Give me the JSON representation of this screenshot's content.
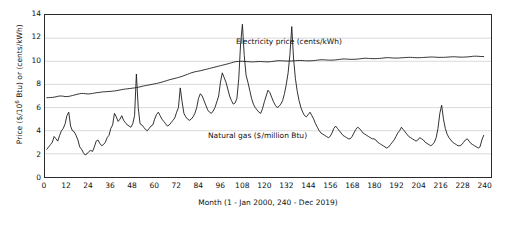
{
  "chart_data": {
    "type": "line",
    "title": "",
    "xlabel": "Month (1 - Jan 2000, 240 - Dec 2019)",
    "ylabel_html": "Price ($/10<sup>6</sup> Btu) or (cents/kWh)",
    "ylabel": "Price ($/10^6 Btu) or (cents/kWh)",
    "xlim": [
      0,
      244
    ],
    "ylim": [
      0,
      14
    ],
    "xticks": [
      0,
      12,
      24,
      36,
      48,
      60,
      72,
      84,
      96,
      108,
      120,
      132,
      144,
      156,
      168,
      180,
      192,
      204,
      216,
      228,
      240
    ],
    "yticks": [
      0,
      2,
      4,
      6,
      8,
      10,
      12,
      14
    ],
    "grid": "horizontal",
    "legend_position": "inline-annotations",
    "annotations": [
      {
        "name": "electricity-price",
        "text": "Electricity price (cents/kWh)"
      },
      {
        "name": "natural-gas",
        "text": "Natural gas ($/million Btu)"
      }
    ],
    "series": [
      {
        "name": "Electricity price (cents/kWh)",
        "color": "#1a1a1a",
        "values": [
          6.85,
          6.86,
          6.87,
          6.88,
          6.9,
          6.93,
          6.97,
          7.0,
          7.0,
          6.98,
          6.95,
          6.95,
          6.97,
          7.0,
          7.04,
          7.08,
          7.12,
          7.16,
          7.2,
          7.22,
          7.22,
          7.2,
          7.18,
          7.18,
          7.2,
          7.22,
          7.25,
          7.28,
          7.3,
          7.32,
          7.34,
          7.36,
          7.37,
          7.38,
          7.39,
          7.4,
          7.42,
          7.44,
          7.46,
          7.49,
          7.52,
          7.55,
          7.58,
          7.6,
          7.62,
          7.64,
          7.66,
          7.68,
          7.7,
          7.73,
          7.76,
          7.79,
          7.83,
          7.87,
          7.9,
          7.93,
          7.96,
          7.99,
          8.02,
          8.05,
          8.08,
          8.12,
          8.16,
          8.2,
          8.25,
          8.3,
          8.35,
          8.4,
          8.44,
          8.48,
          8.52,
          8.56,
          8.6,
          8.65,
          8.7,
          8.76,
          8.82,
          8.88,
          8.94,
          9.0,
          9.05,
          9.09,
          9.12,
          9.15,
          9.18,
          9.22,
          9.26,
          9.3,
          9.34,
          9.38,
          9.42,
          9.46,
          9.5,
          9.54,
          9.58,
          9.62,
          9.66,
          9.7,
          9.74,
          9.78,
          9.82,
          9.87,
          9.92,
          9.96,
          9.98,
          9.99,
          10.0,
          10.0,
          9.99,
          9.98,
          9.97,
          9.96,
          9.95,
          9.95,
          9.96,
          9.97,
          9.98,
          9.98,
          9.97,
          9.96,
          9.95,
          9.95,
          9.96,
          9.98,
          10.0,
          10.02,
          10.04,
          10.05,
          10.05,
          10.04,
          10.03,
          10.02,
          10.02,
          10.02,
          10.03,
          10.04,
          10.05,
          10.06,
          10.07,
          10.07,
          10.06,
          10.05,
          10.04,
          10.04,
          10.04,
          10.05,
          10.06,
          10.08,
          10.1,
          10.12,
          10.13,
          10.13,
          10.12,
          10.11,
          10.1,
          10.1,
          10.1,
          10.11,
          10.12,
          10.14,
          10.16,
          10.18,
          10.2,
          10.2,
          10.19,
          10.18,
          10.17,
          10.17,
          10.17,
          10.18,
          10.19,
          10.21,
          10.23,
          10.25,
          10.26,
          10.26,
          10.25,
          10.24,
          10.23,
          10.23,
          10.23,
          10.24,
          10.25,
          10.26,
          10.28,
          10.3,
          10.31,
          10.31,
          10.3,
          10.29,
          10.28,
          10.28,
          10.28,
          10.29,
          10.3,
          10.31,
          10.32,
          10.33,
          10.34,
          10.34,
          10.33,
          10.32,
          10.31,
          10.31,
          10.31,
          10.32,
          10.33,
          10.34,
          10.35,
          10.36,
          10.37,
          10.37,
          10.36,
          10.35,
          10.34,
          10.34,
          10.34,
          10.34,
          10.35,
          10.36,
          10.37,
          10.38,
          10.39,
          10.39,
          10.38,
          10.37,
          10.36,
          10.36,
          10.36,
          10.37,
          10.38,
          10.39,
          10.41,
          10.43,
          10.44,
          10.44,
          10.43,
          10.42,
          10.41,
          10.41
        ]
      },
      {
        "name": "Natural gas ($/million Btu)",
        "color": "#1a1a1a",
        "values": [
          2.4,
          2.6,
          2.8,
          3.0,
          3.5,
          3.3,
          3.1,
          3.6,
          4.0,
          4.2,
          4.6,
          5.3,
          5.6,
          4.4,
          4.0,
          3.9,
          3.6,
          3.2,
          2.6,
          2.4,
          2.1,
          1.9,
          2.0,
          2.2,
          2.3,
          2.2,
          2.6,
          3.1,
          3.2,
          2.9,
          2.7,
          2.8,
          3.0,
          3.4,
          3.6,
          4.2,
          4.5,
          5.5,
          5.2,
          4.8,
          5.0,
          5.3,
          4.9,
          4.7,
          4.5,
          4.4,
          4.3,
          4.6,
          5.3,
          8.9,
          6.0,
          4.6,
          4.5,
          4.3,
          4.1,
          4.0,
          4.2,
          4.4,
          4.5,
          5.0,
          5.4,
          5.6,
          5.3,
          5.0,
          4.8,
          4.6,
          4.4,
          4.5,
          4.7,
          4.9,
          5.1,
          5.6,
          6.0,
          7.7,
          6.5,
          5.5,
          5.2,
          5.0,
          4.9,
          5.0,
          5.2,
          5.5,
          6.0,
          6.8,
          7.2,
          7.0,
          6.6,
          6.2,
          5.8,
          5.6,
          5.5,
          5.7,
          6.0,
          6.5,
          7.0,
          8.2,
          9.0,
          8.6,
          8.2,
          7.6,
          7.0,
          6.6,
          6.3,
          6.4,
          6.8,
          8.5,
          11.5,
          13.2,
          10.5,
          8.8,
          8.2,
          7.5,
          6.8,
          6.3,
          6.0,
          5.8,
          5.6,
          5.5,
          5.9,
          6.5,
          7.0,
          7.5,
          7.3,
          6.9,
          6.5,
          6.2,
          6.0,
          6.1,
          6.3,
          6.6,
          7.2,
          8.0,
          9.0,
          10.6,
          13.0,
          10.2,
          8.5,
          7.4,
          6.6,
          6.0,
          5.6,
          5.3,
          5.2,
          5.4,
          5.6,
          5.3,
          5.0,
          4.6,
          4.3,
          4.0,
          3.8,
          3.7,
          3.6,
          3.5,
          3.4,
          3.5,
          3.8,
          4.2,
          4.4,
          4.2,
          4.0,
          3.8,
          3.6,
          3.5,
          3.4,
          3.3,
          3.3,
          3.5,
          3.8,
          4.1,
          4.3,
          4.2,
          4.0,
          3.8,
          3.7,
          3.6,
          3.5,
          3.4,
          3.3,
          3.3,
          3.2,
          3.0,
          2.9,
          2.8,
          2.7,
          2.6,
          2.5,
          2.6,
          2.8,
          3.0,
          3.2,
          3.5,
          3.8,
          4.0,
          4.3,
          4.1,
          3.9,
          3.7,
          3.5,
          3.4,
          3.3,
          3.2,
          3.1,
          3.2,
          3.4,
          3.3,
          3.2,
          3.0,
          2.9,
          2.8,
          2.7,
          2.8,
          3.0,
          3.4,
          4.2,
          5.5,
          6.2,
          5.0,
          4.2,
          3.7,
          3.4,
          3.2,
          3.0,
          2.9,
          2.8,
          2.7,
          2.7,
          2.8,
          3.0,
          3.2,
          3.3,
          3.1,
          2.9,
          2.8,
          2.7,
          2.6,
          2.5,
          2.6,
          3.2,
          3.6
        ]
      }
    ]
  },
  "axes": {
    "y_title_prefix": "Price ($/10",
    "y_title_sup": "6",
    "y_title_suffix": " Btu) or (cents/kWh)",
    "x_title": "Month (1 - Jan 2000, 240 - Dec 2019)",
    "yticks": [
      "0",
      "2",
      "4",
      "6",
      "8",
      "10",
      "12",
      "14"
    ],
    "xticks": [
      "0",
      "12",
      "24",
      "36",
      "48",
      "60",
      "72",
      "84",
      "96",
      "108",
      "120",
      "132",
      "144",
      "156",
      "168",
      "180",
      "192",
      "204",
      "216",
      "228",
      "240"
    ]
  },
  "annotations": {
    "electricity": "Electricity price (cents/kWh)",
    "natural_gas": "Natural gas ($/million Btu)"
  }
}
